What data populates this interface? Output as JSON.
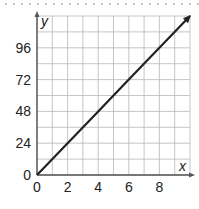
{
  "chart_data": {
    "type": "line",
    "title": "",
    "xlabel": "x",
    "ylabel": "y",
    "x_ticks": [
      "0",
      "2",
      "4",
      "6",
      "8"
    ],
    "y_ticks": [
      "0",
      "24",
      "48",
      "72",
      "96"
    ],
    "xlim": [
      0,
      10
    ],
    "ylim": [
      0,
      120
    ],
    "grid": true,
    "grid_x_step": 1,
    "grid_y_step": 12,
    "series": [
      {
        "name": "y = 12x",
        "x": [
          0,
          2,
          4,
          6,
          8,
          10
        ],
        "y": [
          0,
          24,
          48,
          72,
          96,
          120
        ],
        "arrow_end": true
      }
    ],
    "colors": {
      "line": "#222222",
      "grid": "#b8b8b8",
      "axis": "#555555"
    }
  }
}
